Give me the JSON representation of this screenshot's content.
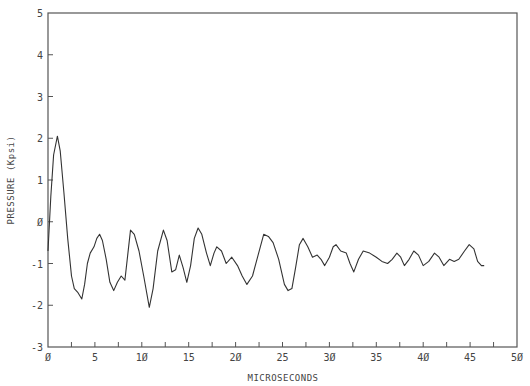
{
  "chart_data": {
    "type": "line",
    "title": "",
    "xlabel": "MICROSECONDS",
    "ylabel": "PRESSURE (Kpsi)",
    "xlim": [
      0,
      50
    ],
    "ylim": [
      -3,
      5
    ],
    "grid": false,
    "legend": null,
    "x_ticks": [
      0,
      5,
      10,
      15,
      20,
      25,
      30,
      35,
      40,
      45,
      50
    ],
    "x_tick_labels": [
      "Ø",
      "5",
      "1Ø",
      "15",
      "2Ø",
      "25",
      "3Ø",
      "35",
      "4Ø",
      "45",
      "5Ø"
    ],
    "x_minor_ticks": [
      2.5,
      7.5,
      12.5,
      17.5,
      22.5,
      27.5,
      32.5,
      37.5,
      42.5,
      47.5
    ],
    "y_ticks": [
      -3,
      -2,
      -1,
      0,
      1,
      2,
      3,
      4,
      5
    ],
    "y_tick_labels": [
      "-3",
      "-2",
      "-1",
      "Ø",
      "1",
      "2",
      "3",
      "4",
      "5"
    ],
    "series": [
      {
        "name": "pressure",
        "x": [
          0.0,
          0.3,
          0.6,
          1.0,
          1.3,
          1.7,
          2.1,
          2.5,
          2.8,
          3.2,
          3.6,
          3.9,
          4.2,
          4.5,
          4.9,
          5.2,
          5.5,
          5.8,
          6.2,
          6.6,
          7.0,
          7.4,
          7.8,
          8.2,
          8.5,
          8.8,
          9.2,
          9.7,
          10.2,
          10.8,
          11.2,
          11.7,
          12.3,
          12.7,
          13.2,
          13.6,
          14.0,
          14.4,
          14.8,
          15.2,
          15.6,
          16.0,
          16.4,
          16.9,
          17.3,
          17.7,
          18.0,
          18.5,
          19.0,
          19.6,
          20.2,
          20.7,
          21.2,
          21.8,
          22.4,
          23.0,
          23.5,
          24.0,
          24.6,
          25.2,
          25.6,
          26.0,
          26.4,
          26.8,
          27.2,
          27.7,
          28.2,
          28.7,
          29.1,
          29.5,
          30.0,
          30.4,
          30.7,
          31.2,
          31.8,
          32.2,
          32.6,
          33.1,
          33.6,
          34.3,
          35.0,
          35.6,
          36.2,
          36.7,
          37.2,
          37.6,
          38.0,
          38.5,
          39.0,
          39.5,
          40.0,
          40.6,
          41.2,
          41.7,
          42.2,
          42.8,
          43.3,
          43.8,
          44.4,
          44.9,
          45.4,
          45.8,
          46.2,
          46.5
        ],
        "values": [
          -0.7,
          0.6,
          1.6,
          2.05,
          1.7,
          0.7,
          -0.4,
          -1.3,
          -1.6,
          -1.7,
          -1.85,
          -1.5,
          -1.0,
          -0.75,
          -0.6,
          -0.4,
          -0.3,
          -0.45,
          -0.9,
          -1.45,
          -1.65,
          -1.45,
          -1.3,
          -1.4,
          -0.8,
          -0.2,
          -0.3,
          -0.7,
          -1.3,
          -2.05,
          -1.6,
          -0.7,
          -0.2,
          -0.45,
          -1.2,
          -1.15,
          -0.8,
          -1.1,
          -1.45,
          -1.05,
          -0.4,
          -0.15,
          -0.3,
          -0.75,
          -1.05,
          -0.75,
          -0.6,
          -0.7,
          -1.0,
          -0.85,
          -1.05,
          -1.3,
          -1.5,
          -1.3,
          -0.8,
          -0.3,
          -0.35,
          -0.5,
          -0.9,
          -1.5,
          -1.65,
          -1.6,
          -1.1,
          -0.55,
          -0.4,
          -0.6,
          -0.85,
          -0.8,
          -0.9,
          -1.05,
          -0.85,
          -0.6,
          -0.55,
          -0.7,
          -0.75,
          -1.0,
          -1.2,
          -0.9,
          -0.7,
          -0.75,
          -0.85,
          -0.95,
          -1.0,
          -0.9,
          -0.75,
          -0.85,
          -1.05,
          -0.9,
          -0.7,
          -0.8,
          -1.05,
          -0.95,
          -0.75,
          -0.85,
          -1.05,
          -0.9,
          -0.95,
          -0.9,
          -0.7,
          -0.55,
          -0.65,
          -0.95,
          -1.05,
          -1.05
        ]
      }
    ]
  },
  "plot": {
    "left_px": 48,
    "right_px": 517,
    "top_px": 13,
    "bottom_px": 347,
    "line_color": "#333333",
    "axis_color": "#555555"
  }
}
